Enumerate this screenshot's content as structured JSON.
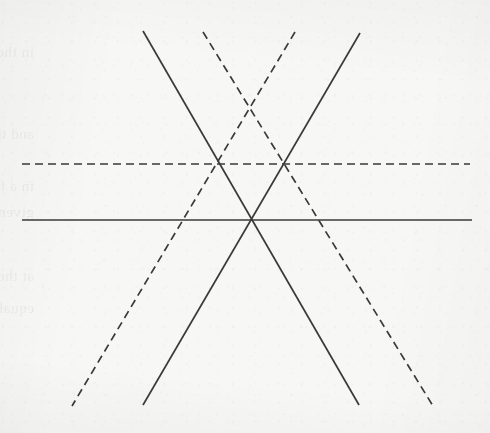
{
  "figure": {
    "canvas": {
      "width": 490,
      "height": 433
    },
    "background_color": "#f7f7f6",
    "ink_color": "#3a3a3a",
    "dash_pattern": "8 5",
    "solid_stroke_width": 1.7,
    "dashed_stroke_width": 1.7,
    "concurrency_point": {
      "x": 251,
      "y": 220
    },
    "solid_lines": [
      {
        "name": "solid-horizontal",
        "role": "horizontal axis through the concurrency point",
        "x1": 22,
        "y1": 220,
        "x2": 472,
        "y2": 220
      },
      {
        "name": "solid-diagonal-descending",
        "role": "diagonal from upper-left to lower-right",
        "x1": 143,
        "y1": 31,
        "x2": 359,
        "y2": 405
      },
      {
        "name": "solid-diagonal-ascending",
        "role": "diagonal from upper-right to lower-left",
        "x1": 360,
        "y1": 33,
        "x2": 143,
        "y2": 405
      }
    ],
    "dashed_lines": [
      {
        "name": "dashed-horizontal",
        "role": "horizontal line above the concurrency point",
        "x1": 22,
        "y1": 164,
        "x2": 470,
        "y2": 164
      },
      {
        "name": "dashed-diagonal-descending",
        "role": "dashed diagonal from upper-left to lower-right",
        "x1": 203,
        "y1": 32,
        "x2": 433,
        "y2": 406
      },
      {
        "name": "dashed-diagonal-ascending",
        "role": "dashed diagonal from upper-right to lower-left",
        "x1": 295,
        "y1": 32,
        "x2": 72,
        "y2": 406
      }
    ],
    "intersections": [
      {
        "name": "left-upper-crossing",
        "x": 220,
        "y": 164
      },
      {
        "name": "right-upper-crossing",
        "x": 288,
        "y": 164
      },
      {
        "name": "center-concurrency",
        "x": 251,
        "y": 220
      }
    ]
  },
  "bleedthrough": {
    "note": "Illegible mirrored show-through text from the reverse side of the page",
    "lines": [
      {
        "text": "in the beginning of the segment",
        "x": 34,
        "y": 44,
        "size": 15,
        "rotate": -0.4
      },
      {
        "text": "and the ratio",
        "x": 34,
        "y": 126,
        "size": 15,
        "rotate": -0.3
      },
      {
        "text": "in a figure of the same measure the",
        "x": 34,
        "y": 178,
        "size": 15,
        "rotate": -0.35
      },
      {
        "text": "given straight",
        "x": 34,
        "y": 204,
        "size": 15,
        "rotate": -0.3
      },
      {
        "text": "at the center of the circle and",
        "x": 34,
        "y": 268,
        "size": 15,
        "rotate": -0.35
      },
      {
        "text": "equal to the base",
        "x": 34,
        "y": 300,
        "size": 15,
        "rotate": -0.3
      }
    ]
  }
}
